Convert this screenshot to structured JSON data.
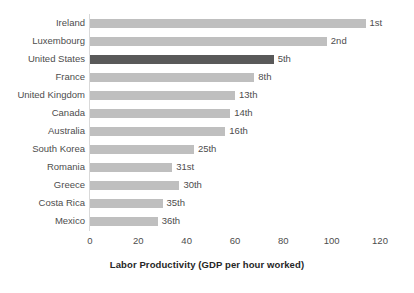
{
  "chart_data": {
    "type": "bar",
    "orientation": "horizontal",
    "title": "",
    "subtitle": "",
    "xlabel": "Labor Productivity (GDP per hour worked)",
    "ylabel": "",
    "xlim": [
      0,
      120
    ],
    "xticks": [
      0,
      20,
      40,
      60,
      80,
      100,
      120
    ],
    "xtick_labels": [
      "0",
      "20",
      "40",
      "60",
      "80",
      "100",
      "120"
    ],
    "grid": false,
    "legend": "none",
    "categories": [
      "Ireland",
      "Luxembourg",
      "United States",
      "France",
      "United Kingdom",
      "Canada",
      "Australia",
      "South Korea",
      "Romania",
      "Greece",
      "Costa Rica",
      "Mexico"
    ],
    "values": [
      114,
      98,
      76,
      68,
      60,
      58,
      56,
      43,
      34,
      37,
      30,
      28
    ],
    "data_labels": [
      "1st",
      "2nd",
      "5th",
      "8th",
      "13th",
      "14th",
      "16th",
      "25th",
      "31st",
      "30th",
      "35th",
      "36th"
    ],
    "highlight_category": "United States",
    "colors": {
      "bar": "#bfbfbf",
      "bar_highlight": "#595959",
      "text": "#4d4d4d",
      "axis_line": "#d9d9d9",
      "background": "#ffffff"
    }
  }
}
